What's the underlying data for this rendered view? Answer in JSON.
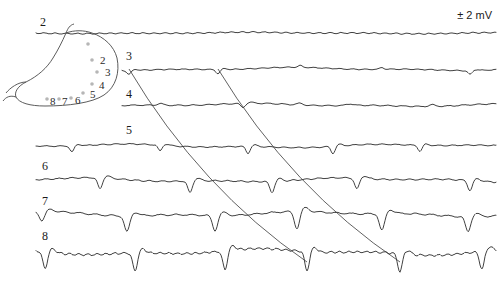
{
  "figure": {
    "kind": "electrophysiology-multichannel-recording",
    "scale_bar": {
      "label": "± 2 mV"
    },
    "channel_labels": [
      "2",
      "3",
      "4",
      "5",
      "6",
      "7",
      "8"
    ],
    "diagram": {
      "name": "stomach-outline",
      "electrode_labels": [
        "2",
        "3",
        "4",
        "5",
        "6",
        "7",
        "8"
      ]
    }
  },
  "chart_data": {
    "type": "line",
    "title": "",
    "xlabel": "",
    "ylabel": "",
    "annotations": [
      "± 2 mV"
    ],
    "grid": false,
    "legend": "none",
    "xlim": [
      0,
      500
    ],
    "channels": [
      {
        "name": "2",
        "label": "2",
        "label_x": 40,
        "label_y": 18,
        "baseline_y": 33,
        "x_start": 36,
        "x_end": 496,
        "amplitude": 1.2,
        "spikes": [],
        "ripple": 0.9,
        "ripple_period": 11
      },
      {
        "name": "3",
        "label": "3",
        "label_x": 126,
        "label_y": 52,
        "baseline_y": 69,
        "x_start": 122,
        "x_end": 496,
        "amplitude": 2.5,
        "spikes": [
          {
            "x": 129,
            "depth": 4,
            "width": 7
          },
          {
            "x": 218,
            "depth": 4,
            "width": 7
          },
          {
            "x": 300,
            "depth": -3,
            "width": 7
          },
          {
            "x": 382,
            "depth": -3,
            "width": 7
          },
          {
            "x": 470,
            "depth": 4,
            "width": 7
          }
        ],
        "ripple": 0.7,
        "ripple_period": 13
      },
      {
        "name": "4",
        "label": "4",
        "label_x": 126,
        "label_y": 90,
        "baseline_y": 105,
        "x_start": 122,
        "x_end": 496,
        "amplitude": 2.5,
        "spikes": [
          {
            "x": 160,
            "depth": -3,
            "width": 9
          },
          {
            "x": 243,
            "depth": 4,
            "width": 8
          },
          {
            "x": 300,
            "depth": -3,
            "width": 9
          },
          {
            "x": 350,
            "depth": -3,
            "width": 10
          },
          {
            "x": 432,
            "depth": -3,
            "width": 10
          }
        ],
        "ripple": 0.8,
        "ripple_period": 15
      },
      {
        "name": "5",
        "label": "5",
        "label_x": 126,
        "label_y": 126,
        "baseline_y": 146,
        "x_start": 36,
        "x_end": 496,
        "amplitude": 3,
        "spikes": [
          {
            "x": 72,
            "depth": 6,
            "width": 7
          },
          {
            "x": 160,
            "depth": 6,
            "width": 7
          },
          {
            "x": 248,
            "depth": 7,
            "width": 7
          },
          {
            "x": 333,
            "depth": 7,
            "width": 7
          },
          {
            "x": 420,
            "depth": 6,
            "width": 7
          }
        ],
        "ripple": 0.8,
        "ripple_period": 14
      },
      {
        "name": "6",
        "label": "6",
        "label_x": 42,
        "label_y": 162,
        "baseline_y": 180,
        "x_start": 36,
        "x_end": 496,
        "amplitude": 3.5,
        "spikes": [
          {
            "x": 100,
            "depth": 11,
            "width": 8
          },
          {
            "x": 190,
            "depth": 12,
            "width": 8
          },
          {
            "x": 272,
            "depth": 11,
            "width": 8
          },
          {
            "x": 357,
            "depth": 11,
            "width": 8
          },
          {
            "x": 470,
            "depth": 10,
            "width": 8
          }
        ],
        "ripple": 1.0,
        "ripple_period": 13
      },
      {
        "name": "7",
        "label": "7",
        "label_x": 42,
        "label_y": 197,
        "baseline_y": 214,
        "x_start": 36,
        "x_end": 496,
        "amplitude": 4,
        "spikes": [
          {
            "x": 42,
            "depth": 9,
            "width": 9
          },
          {
            "x": 127,
            "depth": 16,
            "width": 9
          },
          {
            "x": 215,
            "depth": 15,
            "width": 9
          },
          {
            "x": 297,
            "depth": 17,
            "width": 9
          },
          {
            "x": 382,
            "depth": 17,
            "width": 9
          },
          {
            "x": 468,
            "depth": 15,
            "width": 9
          }
        ],
        "ripple": 1.2,
        "ripple_period": 16
      },
      {
        "name": "8",
        "label": "8",
        "label_x": 42,
        "label_y": 232,
        "baseline_y": 252,
        "x_start": 36,
        "x_end": 496,
        "amplitude": 5,
        "spikes": [
          {
            "x": 45,
            "depth": 17,
            "width": 8
          },
          {
            "x": 135,
            "depth": 18,
            "width": 8
          },
          {
            "x": 225,
            "depth": 19,
            "width": 8
          },
          {
            "x": 307,
            "depth": 19,
            "width": 8
          },
          {
            "x": 400,
            "depth": 18,
            "width": 8
          },
          {
            "x": 482,
            "depth": 18,
            "width": 8
          }
        ],
        "ripple": 1.6,
        "ripple_period": 9
      }
    ],
    "propagation_lines": [
      {
        "name": "propagation-line-1",
        "x_top": 129,
        "y_top": 69,
        "x_bottom": 307,
        "y_bottom": 262
      },
      {
        "name": "propagation-line-2",
        "x_top": 218,
        "y_top": 69,
        "x_bottom": 400,
        "y_bottom": 262
      }
    ],
    "electrode_sites": [
      {
        "label": "2",
        "dot_x": 92,
        "dot_y": 60,
        "text_x": 100,
        "text_y": 56
      },
      {
        "label": "3",
        "dot_x": 97,
        "dot_y": 72,
        "text_x": 105,
        "text_y": 68
      },
      {
        "label": "4",
        "dot_x": 92,
        "dot_y": 84,
        "text_x": 99,
        "text_y": 81
      },
      {
        "label": "5",
        "dot_x": 83,
        "dot_y": 93,
        "text_x": 90,
        "text_y": 90
      },
      {
        "label": "6",
        "dot_x": 71,
        "dot_y": 98,
        "text_x": 75,
        "text_y": 96
      },
      {
        "label": "7",
        "dot_x": 59,
        "dot_y": 99,
        "text_x": 62,
        "text_y": 97
      },
      {
        "label": "8",
        "dot_x": 47,
        "dot_y": 99,
        "text_x": 50,
        "text_y": 97
      },
      {
        "label": "",
        "dot_x": 88,
        "dot_y": 44,
        "text_x": 0,
        "text_y": 0
      }
    ]
  }
}
